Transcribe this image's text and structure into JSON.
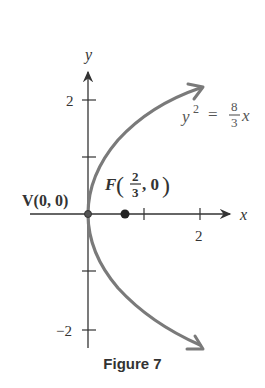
{
  "figure": {
    "caption": "Figure 7",
    "axes": {
      "x_label": "x",
      "y_label": "y",
      "x_ticks": [
        "2"
      ],
      "y_ticks": [
        "2",
        "−2"
      ]
    },
    "equation": {
      "lhs": "y",
      "exp": "2",
      "eq": "=",
      "num": "8",
      "den": "3",
      "var": "x"
    },
    "vertex": {
      "label": "V(0, 0)"
    },
    "focus": {
      "prefix": "F",
      "num": "2",
      "den": "3",
      "suffix": ", 0"
    },
    "colors": {
      "curve": "#7a7a7a",
      "axis": "#333333",
      "text": "#333333"
    }
  }
}
